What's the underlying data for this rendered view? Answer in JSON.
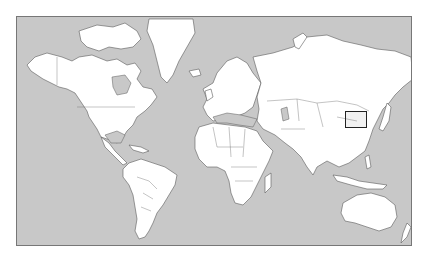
{
  "map": {
    "title": "World map (Mercator) with highlighted region",
    "projection": "mercator",
    "colors": {
      "ocean": "#c8c8c8",
      "land": "#ffffff",
      "coastline": "#5a5a5a",
      "frame": "#777777",
      "highlight": "#222222"
    },
    "frame": {
      "x": 16,
      "y": 16,
      "width": 396,
      "height": 230
    },
    "highlight": {
      "label": "Highlighted region: North China Plain / Bohai Sea (Beijing–Shandong)",
      "x": 344,
      "y": 110,
      "width": 22,
      "height": 17
    }
  }
}
